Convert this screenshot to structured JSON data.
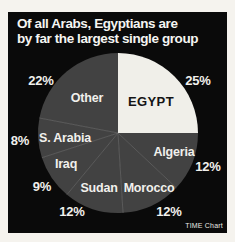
{
  "title": {
    "line1": "Of all Arabs, Egyptians are",
    "line2": "by far the largest single group"
  },
  "credit": "TIME Chart",
  "colors": {
    "page_background": "#f5f3ee",
    "panel_background": "#0a0a0a",
    "slice_dark": "#424242",
    "slice_highlight": "#f0efe9",
    "slice_divider": "#6e6e6e",
    "text_light": "#f1f0ec",
    "text_dark": "#141414"
  },
  "chart_data": {
    "type": "pie",
    "title": "Of all Arabs, Egyptians are by far the largest single group",
    "direction": "clockwise",
    "start_angle_deg": 0,
    "legend": "none (labels placed on and around slices)",
    "source": "TIME Chart",
    "slices": [
      {
        "label": "EGYPT",
        "value": 25,
        "pct": "25%",
        "color": "#f0efe9",
        "text_color": "#141414"
      },
      {
        "label": "Algeria",
        "value": 12,
        "pct": "12%",
        "color": "#424242",
        "text_color": "#f1f0ec"
      },
      {
        "label": "Morocco",
        "value": 12,
        "pct": "12%",
        "color": "#424242",
        "text_color": "#f1f0ec"
      },
      {
        "label": "Sudan",
        "value": 12,
        "pct": "12%",
        "color": "#424242",
        "text_color": "#f1f0ec"
      },
      {
        "label": "Iraq",
        "value": 9,
        "pct": "9%",
        "color": "#424242",
        "text_color": "#f1f0ec"
      },
      {
        "label": "S. Arabia",
        "value": 8,
        "pct": "8%",
        "color": "#424242",
        "text_color": "#f1f0ec"
      },
      {
        "label": "Other",
        "value": 22,
        "pct": "22%",
        "color": "#424242",
        "text_color": "#f1f0ec"
      }
    ]
  }
}
